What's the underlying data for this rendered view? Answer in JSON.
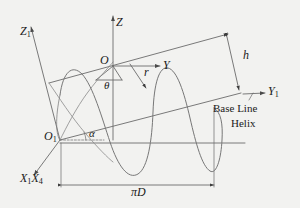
{
  "figure": {
    "background_color": "#f2f2f0",
    "line_color": "#6b6b6b",
    "text_color": "#1a1a1a"
  },
  "axes": [
    {
      "id": "z",
      "name": "Z",
      "label": "Z",
      "subscript": "",
      "origin": "O"
    },
    {
      "id": "z1",
      "name": "Z1",
      "label": "Z",
      "subscript": "1",
      "origin": "O1"
    },
    {
      "id": "y",
      "name": "Y",
      "label": "Y",
      "subscript": "",
      "origin": "O"
    },
    {
      "id": "y1",
      "name": "Y1",
      "label": "Y",
      "subscript": "1",
      "origin": "O1"
    },
    {
      "id": "x1x4",
      "name": "X1X4",
      "label": "X",
      "subscript": "1",
      "label2": "X",
      "subscript2": "4",
      "origin": "O1"
    }
  ],
  "origins": [
    {
      "id": "o",
      "label": "O",
      "subscript": ""
    },
    {
      "id": "o1",
      "label": "O",
      "subscript": "1"
    }
  ],
  "angles": [
    {
      "id": "theta",
      "label": "θ",
      "description": "angle at origin O"
    },
    {
      "id": "alpha",
      "label": "α",
      "description": "helix lead angle at origin O1"
    }
  ],
  "dimensions": [
    {
      "id": "r",
      "label": "r",
      "description": "radius"
    },
    {
      "id": "h",
      "label": "h",
      "description": "lead / height"
    },
    {
      "id": "piD",
      "label": "πD",
      "description": "circumference"
    }
  ],
  "annotations": [
    {
      "id": "base-line",
      "line1": "Base Line",
      "line2": "Helix"
    }
  ],
  "legend": {
    "base_line": "Base Line",
    "helix": "Helix"
  }
}
